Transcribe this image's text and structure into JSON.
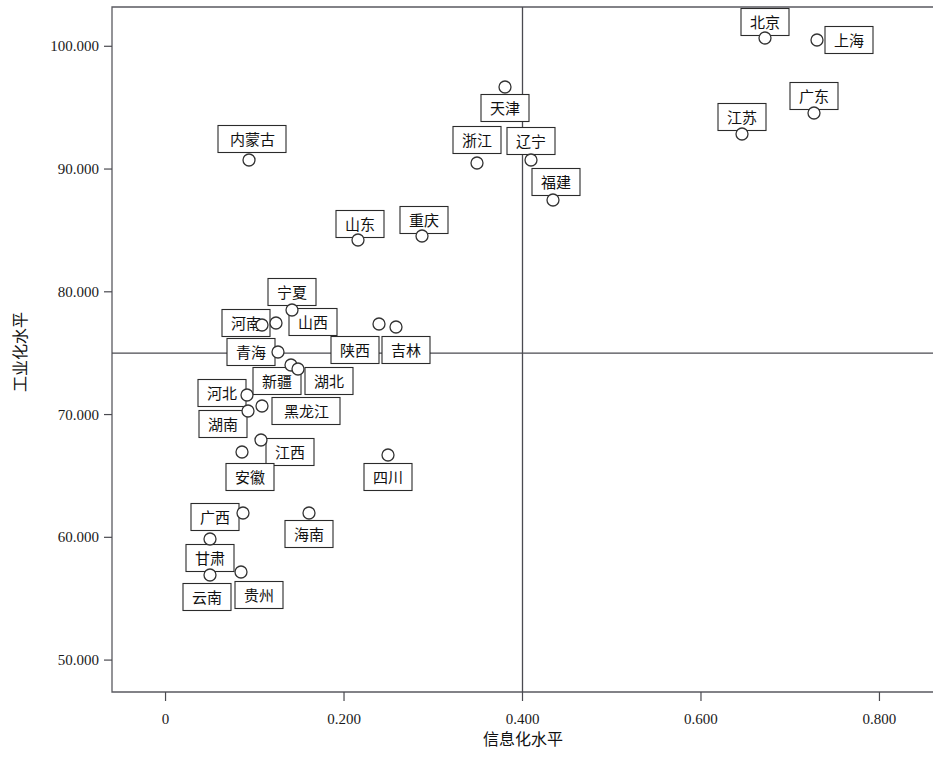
{
  "chart_data": {
    "type": "scatter",
    "title": "",
    "xlabel": "信息化水平",
    "ylabel": "工业化水平",
    "xlim": [
      -0.06,
      0.86
    ],
    "ylim": [
      47.4,
      103.2
    ],
    "xticks": [
      "0",
      "0.200",
      "0.400",
      "0.600",
      "0.800"
    ],
    "xtick_values": [
      0,
      0.2,
      0.4,
      0.6,
      0.8
    ],
    "yticks": [
      "50.000",
      "60.000",
      "70.000",
      "80.000",
      "90.000",
      "100.000"
    ],
    "ytick_values": [
      50,
      60,
      70,
      80,
      90,
      100
    ],
    "grid": false,
    "legend": "none",
    "reference_lines": {
      "vertical_x": 0.4,
      "horizontal_y": 75.0
    },
    "marker_style": "open-circle",
    "points": [
      {
        "label": "北京",
        "x": 0.652,
        "y": 100.1,
        "lx": 765,
        "ly": 38,
        "bx": 765,
        "by": 22,
        "bw": 48,
        "bh": 27
      },
      {
        "label": "上海",
        "x": 0.712,
        "y": 99.85,
        "lx": 817,
        "ly": 40,
        "bx": 849,
        "by": 40,
        "bw": 48,
        "bh": 27
      },
      {
        "label": "江苏",
        "x": 0.628,
        "y": 92.8,
        "lx": 742,
        "ly": 134,
        "bx": 742,
        "by": 117,
        "bw": 48,
        "bh": 27
      },
      {
        "label": "广东",
        "x": 0.711,
        "y": 94.1,
        "lx": 814,
        "ly": 113,
        "bx": 814,
        "by": 96,
        "bw": 48,
        "bh": 27
      },
      {
        "label": "天津",
        "x": 0.372,
        "y": 96.2,
        "lx": 505,
        "ly": 87,
        "bx": 505,
        "by": 108,
        "bw": 48,
        "bh": 27
      },
      {
        "label": "浙江",
        "x": 0.346,
        "y": 90.7,
        "lx": 477,
        "ly": 163,
        "bx": 477,
        "by": 140,
        "bw": 48,
        "bh": 27
      },
      {
        "label": "辽宁",
        "x": 0.404,
        "y": 90.5,
        "lx": 531,
        "ly": 160,
        "bx": 531,
        "by": 141,
        "bw": 48,
        "bh": 27
      },
      {
        "label": "福建",
        "x": 0.425,
        "y": 87.4,
        "lx": 553,
        "ly": 200,
        "bx": 556,
        "by": 182,
        "bw": 48,
        "bh": 27
      },
      {
        "label": "内蒙古",
        "x": 0.094,
        "y": 90.8,
        "lx": 249,
        "ly": 160,
        "bx": 252,
        "by": 139,
        "bw": 68,
        "bh": 27
      },
      {
        "label": "山东",
        "x": 0.218,
        "y": 83.7,
        "lx": 358,
        "ly": 240,
        "bx": 360,
        "by": 224,
        "bw": 48,
        "bh": 27
      },
      {
        "label": "重庆",
        "x": 0.292,
        "y": 84.4,
        "lx": 422,
        "ly": 236,
        "bx": 424,
        "by": 220,
        "bw": 48,
        "bh": 27
      },
      {
        "label": "宁夏",
        "x": 0.15,
        "y": 77.6,
        "lx": 292,
        "ly": 310,
        "bx": 292,
        "by": 292,
        "bw": 48,
        "bh": 27
      },
      {
        "label": "河南",
        "x": 0.13,
        "y": 77.0,
        "lx": 276,
        "ly": 323,
        "bx": 246,
        "by": 323,
        "bw": 48,
        "bh": 27
      },
      {
        "label": "山西",
        "x": 0.12,
        "y": 76.9,
        "lx": 262,
        "ly": 325,
        "bx": 313,
        "by": 322,
        "bw": 48,
        "bh": 27
      },
      {
        "label": "青海",
        "x": 0.133,
        "y": 75.2,
        "lx": 278,
        "ly": 352,
        "bx": 251,
        "by": 352,
        "bw": 48,
        "bh": 27
      },
      {
        "label": "陕西",
        "x": 0.249,
        "y": 77.3,
        "lx": 379,
        "ly": 324,
        "bx": 355,
        "by": 350,
        "bw": 48,
        "bh": 27
      },
      {
        "label": "吉林",
        "x": 0.263,
        "y": 77.0,
        "lx": 396,
        "ly": 327,
        "bx": 406,
        "by": 350,
        "bw": 48,
        "bh": 27
      },
      {
        "label": "新疆",
        "x": 0.148,
        "y": 74.3,
        "lx": 291,
        "ly": 365,
        "bx": 277,
        "by": 381,
        "bw": 48,
        "bh": 27
      },
      {
        "label": "湖北",
        "x": 0.157,
        "y": 74.0,
        "lx": 298,
        "ly": 369,
        "bx": 329,
        "by": 381,
        "bw": 48,
        "bh": 27
      },
      {
        "label": "河北",
        "x": 0.108,
        "y": 71.6,
        "lx": 247,
        "ly": 395,
        "bx": 222,
        "by": 393,
        "bw": 48,
        "bh": 27
      },
      {
        "label": "黑龙江",
        "x": 0.124,
        "y": 70.7,
        "lx": 262,
        "ly": 406,
        "bx": 306,
        "by": 411,
        "bw": 68,
        "bh": 27
      },
      {
        "label": "湖南",
        "x": 0.109,
        "y": 70.3,
        "lx": 248,
        "ly": 411,
        "bx": 223,
        "by": 424,
        "bw": 48,
        "bh": 27
      },
      {
        "label": "江西",
        "x": 0.122,
        "y": 67.5,
        "lx": 261,
        "ly": 440,
        "bx": 290,
        "by": 452,
        "bw": 48,
        "bh": 27
      },
      {
        "label": "安徽",
        "x": 0.104,
        "y": 66.4,
        "lx": 242,
        "ly": 452,
        "bx": 250,
        "by": 477,
        "bw": 48,
        "bh": 27
      },
      {
        "label": "四川",
        "x": 0.251,
        "y": 66.2,
        "lx": 388,
        "ly": 455,
        "bx": 388,
        "by": 477,
        "bw": 48,
        "bh": 27
      },
      {
        "label": "广西",
        "x": 0.105,
        "y": 62.2,
        "lx": 243,
        "ly": 513,
        "bx": 215,
        "by": 517,
        "bw": 48,
        "bh": 27
      },
      {
        "label": "海南",
        "x": 0.164,
        "y": 62.1,
        "lx": 309,
        "ly": 513,
        "bx": 309,
        "by": 534,
        "bw": 48,
        "bh": 27
      },
      {
        "label": "甘肃",
        "x": 0.076,
        "y": 60.0,
        "lx": 210,
        "ly": 539,
        "bx": 210,
        "by": 558,
        "bw": 48,
        "bh": 27
      },
      {
        "label": "云南",
        "x": 0.076,
        "y": 57.1,
        "lx": 210,
        "ly": 575,
        "bx": 207,
        "by": 597,
        "bw": 48,
        "bh": 27
      },
      {
        "label": "贵州",
        "x": 0.103,
        "y": 57.4,
        "lx": 241,
        "ly": 572,
        "bx": 259,
        "by": 595,
        "bw": 48,
        "bh": 27
      }
    ]
  },
  "axes": {
    "x_title": "信息化水平",
    "y_title": "工业化水平"
  }
}
